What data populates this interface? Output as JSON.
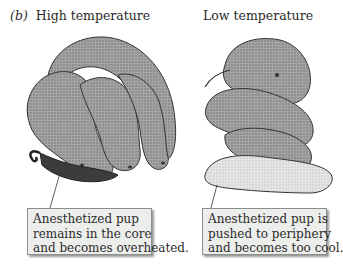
{
  "panel_label": "(b)",
  "panels": [
    {
      "title": "High temperature",
      "callout": [
        "Anesthetized pup",
        "remains in the core",
        "and becomes overheated."
      ]
    },
    {
      "title": "Low temperature",
      "callout": [
        "Anesthetized pup is",
        "pushed to periphery",
        "and becomes too cool."
      ]
    }
  ],
  "colors": {
    "callout_fill": "#eceeec",
    "callout_border": "#8a8f8a",
    "pup_gray": "#9a9a9a",
    "pup_dark": "#4a4a4a",
    "pup_light": "#e8e8e8",
    "anesthetized_pup_dark": "#3a3a3a"
  }
}
